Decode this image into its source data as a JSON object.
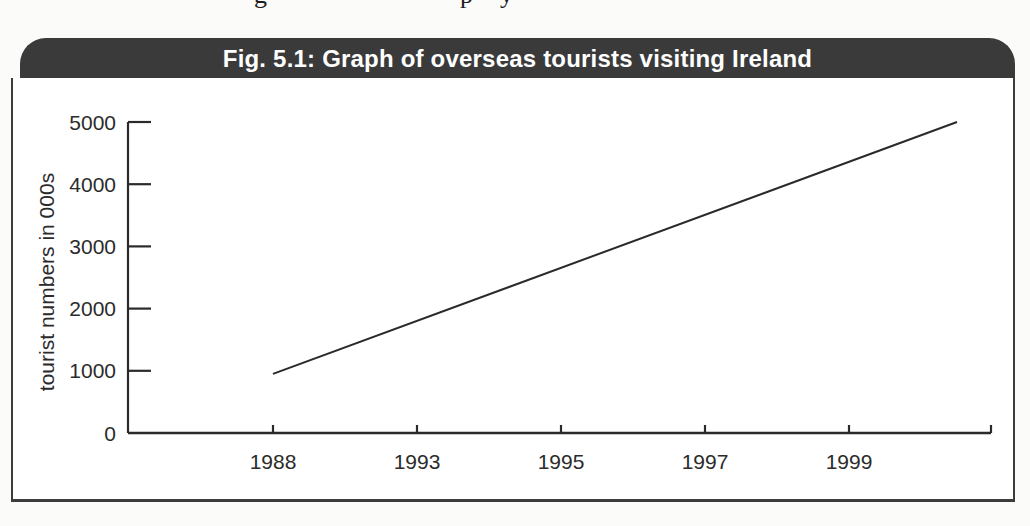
{
  "page": {
    "top_remnant_chars": [
      "g",
      "p",
      "y"
    ]
  },
  "figure": {
    "title": "Fig. 5.1: Graph of overseas tourists visiting Ireland",
    "title_bar_color": "#3a3a3a",
    "title_text_color": "#ffffff",
    "border_color": "#3c3c3c",
    "background": "#ffffff"
  },
  "chart_data": {
    "type": "line",
    "title": "Fig. 5.1: Graph of overseas tourists visiting Ireland",
    "xlabel": "",
    "ylabel": "tourist numbers in 000s",
    "x_tick_labels": [
      "1988",
      "1993",
      "1995",
      "1997",
      "1999"
    ],
    "x_tick_years": [
      1988,
      1993,
      1995,
      1997,
      1999
    ],
    "y_ticks": [
      0,
      1000,
      2000,
      3000,
      4000,
      5000
    ],
    "y_tick_labels": [
      "0",
      "1000",
      "2000",
      "3000",
      "4000",
      "5000"
    ],
    "ylim": [
      0,
      5000
    ],
    "grid": false,
    "legend": "none",
    "axis_color": "#2a2a2a",
    "line_color": "#2a2a2a",
    "tick_label_color": "#2b2b2b",
    "series": [
      {
        "name": "overseas tourists visiting Ireland (000s)",
        "style": "single straight line, steadily increasing, no markers",
        "points": [
          {
            "year": 1988,
            "tourists_000s": 950
          },
          {
            "year": 2000.5,
            "tourists_000s": 5000
          }
        ]
      }
    ]
  }
}
